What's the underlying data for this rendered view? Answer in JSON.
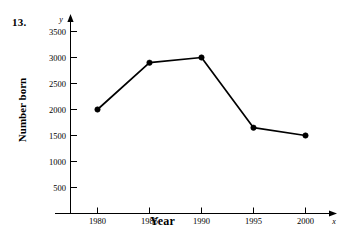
{
  "figure": {
    "problem_number": "13.",
    "y_axis_title": "Number born",
    "x_axis_title": "Year",
    "y_axis_letter": "y",
    "x_axis_letter": "x"
  },
  "chart_data": {
    "type": "line",
    "title": "",
    "xlabel": "Year",
    "ylabel": "Number born",
    "categories": [
      "1980",
      "1985",
      "1990",
      "1995",
      "2000"
    ],
    "x": [
      1980,
      1985,
      1990,
      1995,
      2000
    ],
    "values": [
      2000,
      2900,
      3000,
      1650,
      1500
    ],
    "xlim": [
      1977.5,
      2002.5
    ],
    "ylim": [
      0,
      3750
    ],
    "x_ticks": [
      "1980",
      "1985",
      "1990",
      "1995",
      "2000"
    ],
    "y_ticks": [
      "500",
      "1000",
      "1500",
      "2000",
      "2500",
      "3000",
      "3500"
    ],
    "y_tick_values": [
      500,
      1000,
      1500,
      2000,
      2500,
      3000,
      3500
    ],
    "grid": false,
    "legend": "none",
    "series": [
      {
        "name": "Number born",
        "values": [
          2000,
          2900,
          3000,
          1650,
          1500
        ],
        "color": "#000000",
        "marker": "filled-circle"
      }
    ],
    "colors": {
      "line": "#000000",
      "marker": "#000000",
      "axis": "#000000",
      "background": "#ffffff"
    }
  }
}
